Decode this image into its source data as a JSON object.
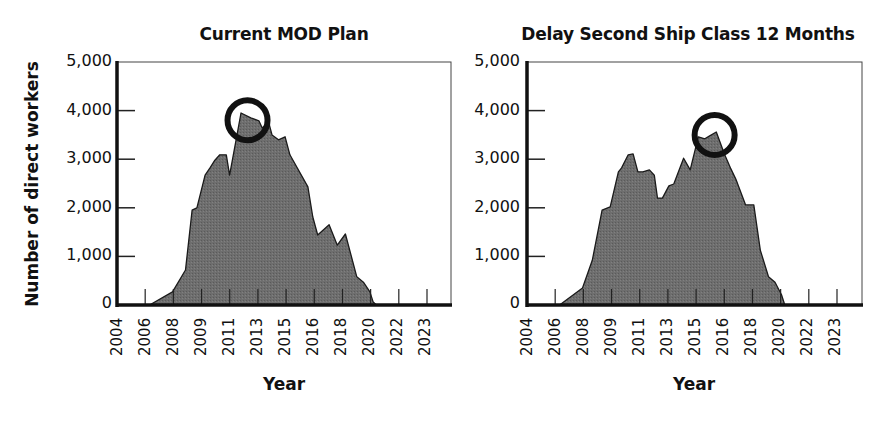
{
  "figure": {
    "ylabel": "Number of direct workers",
    "xlabel": "Year",
    "fill_color": "#6e6e6e",
    "line_color": "#1a1a1a",
    "highlight_circle_color": "#111111"
  },
  "chart_data": [
    {
      "type": "area",
      "title": "Current MOD Plan",
      "xlabel": "Year",
      "ylabel": "Number of direct workers",
      "ylim": [
        0,
        5000
      ],
      "yticks": [
        "0",
        "1,000",
        "2,000",
        "3,000",
        "4,000",
        "5,000"
      ],
      "xtick_labels": [
        "2004",
        "2006",
        "2008",
        "2009",
        "2011",
        "2013",
        "2015",
        "2016",
        "2018",
        "2020",
        "2022",
        "2023"
      ],
      "xlim": [
        2004,
        2023
      ],
      "grid": false,
      "annotation": {
        "type": "circle",
        "x": 2012.0,
        "y": 3800,
        "note": "peak highlighted"
      },
      "x": [
        2004,
        2006.0,
        2007.4,
        2008.2,
        2008.6,
        2008.9,
        2009.4,
        2009.7,
        2010.0,
        2010.3,
        2010.7,
        2010.9,
        2011.3,
        2011.6,
        2012.2,
        2012.7,
        2012.9,
        2013.3,
        2013.5,
        2013.9,
        2014.3,
        2014.6,
        2015.7,
        2016.0,
        2016.3,
        2017.0,
        2017.5,
        2018.0,
        2018.7,
        2019.1,
        2019.5,
        2019.7,
        2019.9,
        2023
      ],
      "values": [
        0,
        0,
        270,
        720,
        1950,
        2000,
        2670,
        2820,
        2980,
        3090,
        3090,
        2670,
        3400,
        3950,
        3850,
        3790,
        3640,
        3760,
        3500,
        3400,
        3460,
        3090,
        2430,
        1810,
        1440,
        1650,
        1230,
        1460,
        580,
        470,
        270,
        60,
        0,
        0
      ]
    },
    {
      "type": "area",
      "title": "Delay Second Ship Class 12 Months",
      "xlabel": "Year",
      "ylabel": "Number of direct workers",
      "ylim": [
        0,
        5000
      ],
      "yticks": [
        "0",
        "1,000",
        "2,000",
        "3,000",
        "4,000",
        "5,000"
      ],
      "xtick_labels": [
        "2004",
        "2006",
        "2008",
        "2009",
        "2011",
        "2013",
        "2015",
        "2016",
        "2018",
        "2020",
        "2022",
        "2023"
      ],
      "xlim": [
        2004,
        2023
      ],
      "grid": false,
      "annotation": {
        "type": "circle",
        "x": 2015.5,
        "y": 3500,
        "note": "peak highlighted"
      },
      "x": [
        2004,
        2006.0,
        2007.4,
        2008.0,
        2008.6,
        2009.1,
        2009.6,
        2009.8,
        2010.2,
        2010.5,
        2010.8,
        2011.1,
        2011.5,
        2011.8,
        2012.0,
        2012.3,
        2012.7,
        2013.0,
        2013.6,
        2014.0,
        2014.5,
        2014.9,
        2015.2,
        2015.6,
        2016.1,
        2016.5,
        2016.8,
        2017.4,
        2017.9,
        2018.3,
        2018.8,
        2019.2,
        2019.6,
        2019.8,
        2023
      ],
      "values": [
        0,
        0,
        350,
        920,
        1950,
        2020,
        2740,
        2820,
        3090,
        3110,
        2740,
        2740,
        2780,
        2670,
        2200,
        2200,
        2450,
        2490,
        3020,
        2780,
        3460,
        3420,
        3480,
        3560,
        3110,
        2800,
        2590,
        2060,
        2060,
        1130,
        580,
        470,
        210,
        0,
        0
      ]
    }
  ]
}
